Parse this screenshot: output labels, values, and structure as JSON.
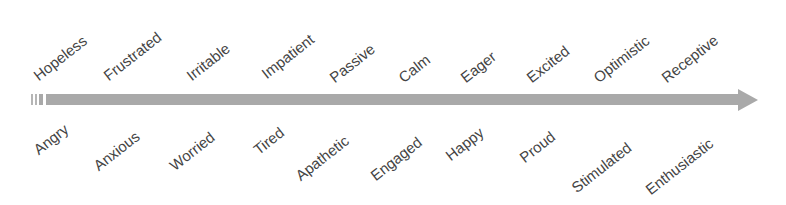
{
  "diagram": {
    "type": "emotion-continuum-arrow",
    "arrow_color": "#a9a9a9",
    "text_color": "#444444",
    "top_labels": [
      "Hopeless",
      "Frustrated",
      "Irritable",
      "Impatient",
      "Passive",
      "Calm",
      "Eager",
      "Excited",
      "Optimistic",
      "Receptive"
    ],
    "bottom_labels": [
      "Angry",
      "Anxious",
      "Worried",
      "Tired",
      "Apathetic",
      "Engaged",
      "Happy",
      "Proud",
      "Stimulated",
      "Enthusiastic"
    ]
  }
}
